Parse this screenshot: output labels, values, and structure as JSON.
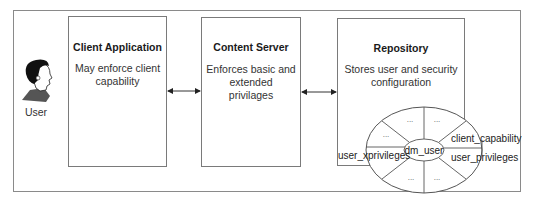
{
  "diagram": {
    "actor": {
      "label": "User",
      "icon": "user-head-icon"
    },
    "boxes": [
      {
        "id": "client",
        "title": "Client Application",
        "description_lines": [
          "May enforce client",
          "capability"
        ]
      },
      {
        "id": "server",
        "title": "Content Server",
        "description_lines": [
          "Enforces basic and",
          "extended privilages"
        ]
      },
      {
        "id": "repository",
        "title": "Repository",
        "description_lines": [
          "Stores user and security",
          "configuration"
        ]
      }
    ],
    "connectors": [
      {
        "from": "client",
        "to": "server",
        "type": "bidirectional-arrow"
      },
      {
        "from": "server",
        "to": "repository",
        "type": "bidirectional-arrow"
      }
    ],
    "object_model": {
      "center": "dm_user",
      "attributes": [
        "client_capability",
        "user_privileges",
        "user_xprivileges"
      ],
      "placeholder": "..."
    }
  }
}
